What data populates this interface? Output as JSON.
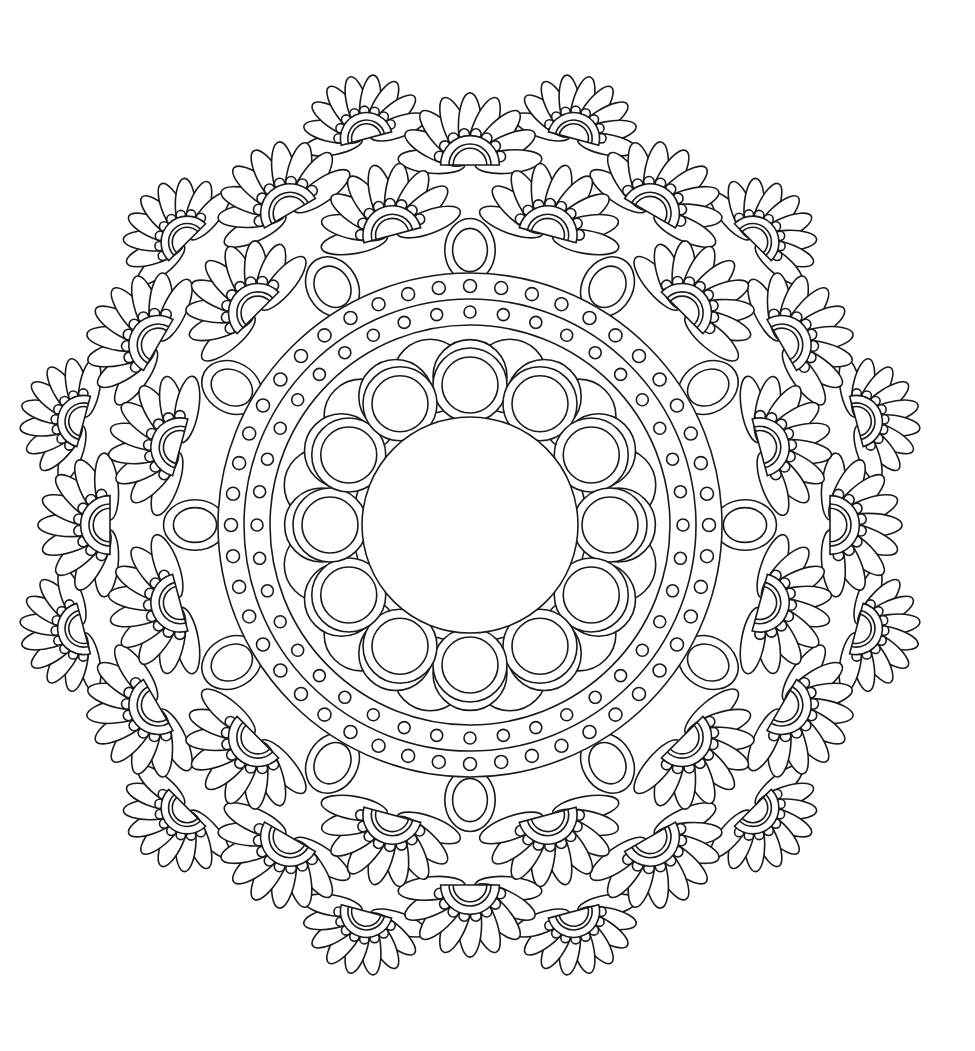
{
  "artwork": {
    "title": "Mandala line-art coloring page",
    "background": "#ffffff",
    "line_color": "#1a1a1a",
    "center": [
      470,
      525
    ],
    "center_hole_radius": 108,
    "inner_circles": {
      "count": 12,
      "ring_radius": 140,
      "outer_r": 37,
      "inner_r": 28,
      "back_offset": 14
    },
    "dot_band": {
      "outer_r": 252,
      "mid_r": 226,
      "inner_r": 200,
      "rows": [
        {
          "r": 239,
          "count": 48,
          "dot_r": 6.5
        },
        {
          "r": 213,
          "count": 40,
          "dot_r": 6
        }
      ]
    },
    "inner_petals": {
      "count": 12,
      "r": 275,
      "outer_arc": 42,
      "inner_arc": 30
    },
    "scallop_layers": [
      {
        "count": 12,
        "r": 300,
        "fan_r": 70,
        "petals": 9,
        "rotation": 15
      },
      {
        "count": 12,
        "r": 360,
        "fan_r": 70,
        "petals": 9,
        "rotation": 0
      },
      {
        "count": 12,
        "r": 400,
        "fan_r": 62,
        "petals": 9,
        "rotation": 15
      }
    ]
  }
}
